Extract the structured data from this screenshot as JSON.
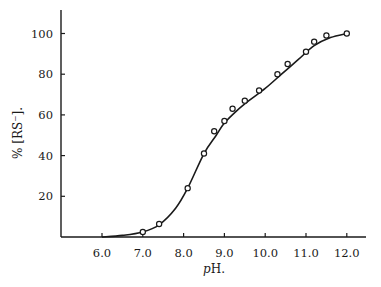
{
  "chart_data": {
    "type": "line",
    "title": "",
    "xlabel": "pH.",
    "ylabel": "% [RS⁻].",
    "xlim": [
      5.0,
      12.5
    ],
    "ylim": [
      0,
      112
    ],
    "x_ticks": [
      6.0,
      7.0,
      8.0,
      9.0,
      10.0,
      11.0,
      12.0
    ],
    "x_tick_labels": [
      "6.0",
      "7.0",
      "8.0",
      "9.0",
      "10.0",
      "11.0",
      "12.0"
    ],
    "y_ticks": [
      20,
      40,
      60,
      80,
      100
    ],
    "y_tick_labels": [
      "20",
      "40",
      "60",
      "80",
      "100"
    ],
    "grid": false,
    "legend": null,
    "series": [
      {
        "name": "observed",
        "marker": "open-circle",
        "x": [
          7.0,
          7.4,
          8.1,
          8.5,
          8.75,
          9.0,
          9.2,
          9.5,
          9.85,
          10.3,
          10.55,
          11.0,
          11.2,
          11.5,
          12.0
        ],
        "y": [
          2.5,
          6.4,
          24,
          41,
          52,
          57,
          63,
          67,
          72,
          80,
          85,
          91,
          96,
          99,
          100
        ]
      },
      {
        "name": "fitted curve",
        "marker": "none",
        "x": [
          6.0,
          6.5,
          7.0,
          7.4,
          7.8,
          8.1,
          8.5,
          8.8,
          9.0,
          9.3,
          9.6,
          10.0,
          10.4,
          10.8,
          11.2,
          11.6,
          12.0
        ],
        "y": [
          0,
          0.8,
          2.5,
          6,
          14,
          24,
          41,
          50,
          56,
          62,
          67,
          73,
          80,
          87,
          94,
          98,
          100
        ]
      }
    ]
  },
  "colors": {
    "ink": "#1a1a1a",
    "background": "#ffffff"
  }
}
